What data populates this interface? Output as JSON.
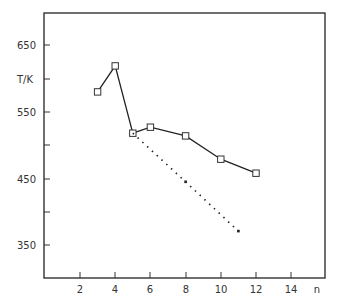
{
  "chart_data": {
    "type": "line",
    "title": "",
    "xlabel": "n",
    "ylabel": "T/K",
    "xlim": [
      0,
      16
    ],
    "ylim": [
      300,
      700
    ],
    "x_ticks": [
      2,
      4,
      6,
      8,
      10,
      12,
      14
    ],
    "x_tick_labels": [
      "2",
      "4",
      "6",
      "8",
      "10",
      "12",
      "14"
    ],
    "y_ticks": [
      350,
      400,
      450,
      500,
      550,
      600,
      650
    ],
    "y_tick_labels": [
      "350",
      "",
      "450",
      "",
      "550",
      "T/K",
      "650"
    ],
    "grid": false,
    "legend": null,
    "series": [
      {
        "name": "measured",
        "style": "solid",
        "marker": "open-square",
        "x": [
          3,
          4,
          5,
          6,
          8,
          10,
          12
        ],
        "y": [
          580,
          619,
          518,
          527,
          514,
          479,
          458
        ]
      },
      {
        "name": "extrapolated",
        "style": "dotted",
        "marker": "small-dot",
        "x": [
          5,
          8,
          11
        ],
        "y": [
          518,
          445,
          371
        ]
      }
    ]
  },
  "labels": {
    "y_axis": "T/K",
    "x_axis": "n",
    "y650": "650",
    "y550": "550",
    "y450": "450",
    "y350": "350",
    "x2": "2",
    "x4": "4",
    "x6": "6",
    "x8": "8",
    "x10": "10",
    "x12": "12",
    "x14": "14"
  }
}
